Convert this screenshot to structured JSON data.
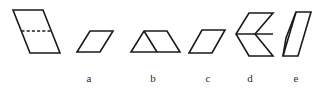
{
  "figure": {
    "type": "geometry-multiple-choice-shapes",
    "background_color": "#ffffff",
    "stroke_color": "#1a1a1a",
    "width": 319,
    "height": 90,
    "prompt_shape": {
      "name": "prompt-parallelogram",
      "description": "steep parallelogram with horizontal dashed line dividing it",
      "outline_points": "13,10 43,10 60,53 30,53",
      "dashed_line_points": "21.5,31 51.5,31"
    },
    "options": [
      {
        "id": "a",
        "label": "a",
        "label_x": 89,
        "label_y": 72,
        "name": "option-a-parallelogram",
        "description": "flat parallelogram slanting right",
        "outline_points": "90,31 113,31 100,52 77,52",
        "inner_lines": []
      },
      {
        "id": "b",
        "label": "b",
        "label_x": 153,
        "label_y": 72,
        "name": "option-b-parallelogram-triangle",
        "description": "parallelogram joined to a triangle forming a trapezoid-like figure",
        "outline_points": "144,31 167,31 180,52 131,52",
        "inner_lines": [
          "157,52 144,31"
        ]
      },
      {
        "id": "c",
        "label": "c",
        "label_x": 208,
        "label_y": 72,
        "name": "option-c-parallelogram",
        "description": "parallelogram slanting right, slightly narrower",
        "outline_points": "202,30 225,30 212,53 189,53",
        "inner_lines": []
      },
      {
        "id": "d",
        "label": "d",
        "label_x": 250,
        "label_y": 72,
        "name": "option-d-chevron",
        "description": "chevron made of two mirrored parallelograms with horizontal divider",
        "outline_points": "249,13 273,13 255,34 273,56 249,56 236,34",
        "inner_lines": [
          "236,34 273,34"
        ]
      },
      {
        "id": "e",
        "label": "e",
        "label_x": 296,
        "label_y": 72,
        "name": "option-e-parallelogram-diagonal",
        "description": "steep parallelogram with internal diagonal forming a triangle",
        "outline_points": "296,12 311,12 298,56 283,56",
        "inner_lines": [
          "296,12 286,38 283,56"
        ]
      }
    ]
  }
}
